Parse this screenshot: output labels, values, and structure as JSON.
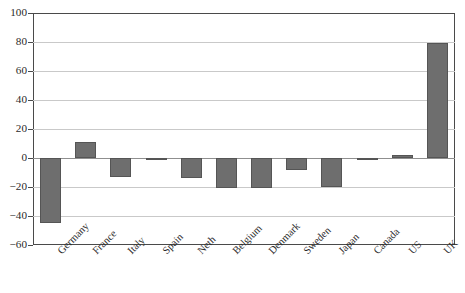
{
  "chart_data": {
    "type": "bar",
    "title": "",
    "subtitle": "",
    "xlabel": "",
    "ylabel": "",
    "ylim": [
      -60,
      100
    ],
    "yticks": [
      -60,
      -40,
      -20,
      0,
      20,
      40,
      60,
      80,
      100
    ],
    "ytick_labels": [
      "−60",
      "−40",
      "−20",
      "0",
      "20",
      "40",
      "60",
      "80",
      "100"
    ],
    "grid": true,
    "legend": false,
    "legend_position": "none",
    "categories": [
      "Germany",
      "France",
      "Italy",
      "Spain",
      "Neth",
      "Belgium",
      "Denmark",
      "Sweden",
      "Japan",
      "Canada",
      "US",
      "UK"
    ],
    "values": [
      -45,
      11,
      -13,
      -1,
      -14,
      -21,
      -21,
      -8,
      -20,
      -1,
      2,
      79
    ],
    "series": [
      {
        "name": "",
        "values": [
          -45,
          11,
          -13,
          -1,
          -14,
          -21,
          -21,
          -8,
          -20,
          -1,
          2,
          79
        ]
      }
    ]
  },
  "style": {
    "bar_fill": "#6e6e6e",
    "bar_border": "#555555",
    "grid_color": "#c9c9c9",
    "zero_line_color": "#8f8f8f",
    "frame_color": "#4a4a4a",
    "text_color": "#2b2b2b",
    "background": "#ffffff"
  }
}
